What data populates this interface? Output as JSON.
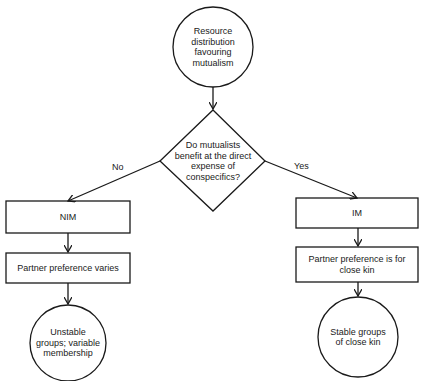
{
  "nodes": {
    "start": {
      "label": "Resource distribution favouring mutualism",
      "shape": "circle"
    },
    "decision": {
      "label": "Do mutualists benefit at the direct expense of conspecifics?",
      "shape": "diamond"
    },
    "nim": {
      "label": "NIM",
      "shape": "rect"
    },
    "im": {
      "label": "IM",
      "shape": "rect"
    },
    "pref_varies": {
      "label": "Partner preference varies",
      "shape": "rect"
    },
    "pref_kin": {
      "label": "Partner preference is for close kin",
      "shape": "rect"
    },
    "unstable": {
      "label": "Unstable groups; variable membership",
      "shape": "circle"
    },
    "stable": {
      "label": "Stable groups of close kin",
      "shape": "circle"
    }
  },
  "edges": {
    "no": {
      "label": "No"
    },
    "yes": {
      "label": "Yes"
    }
  },
  "colors": {
    "stroke": "#1a1a1a",
    "background": "#ffffff"
  }
}
